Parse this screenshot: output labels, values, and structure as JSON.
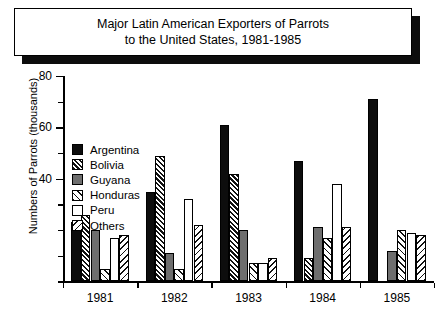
{
  "title": {
    "line1": "Major Latin American Exporters of Parrots",
    "line2": "to the United States, 1981-1985"
  },
  "chart_data": {
    "type": "bar",
    "title": "Major Latin American Exporters of Parrots to the United States, 1981-1985",
    "xlabel": "",
    "ylabel": "Numbers of Parrots (thousands)",
    "ylim": [
      0,
      80
    ],
    "ytick_labels": [
      "80",
      "60",
      "40"
    ],
    "ytick_values": [
      80,
      60,
      40
    ],
    "minor_tick_step": 10,
    "grid": false,
    "legend_position": "upper-left-inside",
    "categories": [
      "1981",
      "1982",
      "1983",
      "1984",
      "1985"
    ],
    "series": [
      {
        "name": "Argentina",
        "pattern": "solid-black",
        "values": [
          23,
          35,
          61,
          47,
          71
        ]
      },
      {
        "name": "Bolivia",
        "pattern": "dense-diagonal",
        "values": [
          26,
          49,
          42,
          9,
          0
        ]
      },
      {
        "name": "Guyana",
        "pattern": "solid-gray",
        "values": [
          20,
          11,
          20,
          21,
          12
        ]
      },
      {
        "name": "Honduras",
        "pattern": "light-diagonal",
        "values": [
          5,
          5,
          7,
          17,
          20
        ]
      },
      {
        "name": "Peru",
        "pattern": "white",
        "values": [
          17,
          32,
          7,
          38,
          19
        ]
      },
      {
        "name": "Others",
        "pattern": "back-diagonal",
        "values": [
          18,
          22,
          9,
          21,
          18
        ]
      }
    ]
  },
  "colors": {
    "black": "#0d0d0d",
    "gray": "#6e6e6e",
    "white": "#ffffff",
    "axis": "#000000"
  }
}
